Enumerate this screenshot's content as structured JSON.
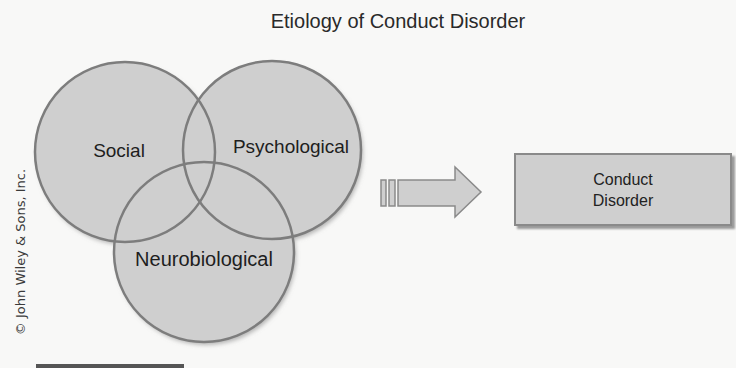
{
  "title": "Etiology of Conduct Disorder",
  "venn": {
    "sets": [
      {
        "name": "social",
        "label": "Social"
      },
      {
        "name": "psychological",
        "label": "Psychological"
      },
      {
        "name": "neurobiological",
        "label": "Neurobiological"
      }
    ]
  },
  "arrow": {
    "icon": "right-arrow-icon",
    "direction": "right"
  },
  "outcome": {
    "line1": "Conduct",
    "line2": "Disorder"
  },
  "copyright": "© John Wiley & Sons, Inc.",
  "colors": {
    "circle_fill": "#cfcfcf",
    "circle_stroke": "#7d7d7d",
    "text": "#222222",
    "background": "#f8f8f7"
  }
}
